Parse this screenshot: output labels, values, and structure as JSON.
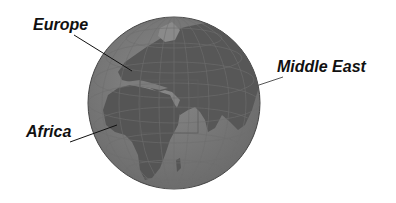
{
  "figure": {
    "type": "globe-map",
    "colors": {
      "ocean": "#7a7a7a",
      "land": "#555555",
      "grid": "#6a6a6a",
      "outline": "#444444",
      "leader": "#111111",
      "background": "#ffffff"
    },
    "labels": [
      {
        "id": "europe",
        "text": "Europe"
      },
      {
        "id": "middle-east",
        "text": "Middle East"
      },
      {
        "id": "africa",
        "text": "Africa"
      }
    ]
  }
}
